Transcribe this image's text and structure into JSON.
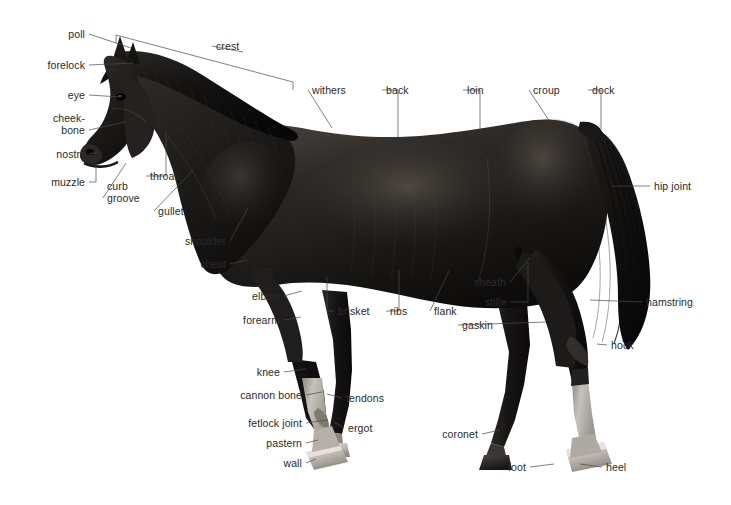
{
  "figure": {
    "view": "left-side profile, facing left",
    "coat_color": "#1d1b1a",
    "background_color": "#ffffff",
    "leader_line_color": "#4a4a4a",
    "label_text_color": "#2a2a2a",
    "marking_color": "#b9b5ae",
    "hoof_color": "#cfcac2"
  },
  "labels": [
    {
      "id": "poll",
      "text": "poll",
      "align": "right",
      "x": 27,
      "y": 28,
      "w": 58,
      "tip": [
        131,
        48
      ]
    },
    {
      "id": "crest",
      "text": "crest",
      "align": "left",
      "x": 216,
      "y": 40,
      "w": 50,
      "tip": [
        243,
        52
      ]
    },
    {
      "id": "forelock",
      "text": "forelock",
      "align": "right",
      "x": 16,
      "y": 59,
      "w": 69,
      "tip": [
        133,
        63
      ]
    },
    {
      "id": "withers",
      "text": "withers",
      "align": "left",
      "x": 312,
      "y": 84,
      "w": 46,
      "tip": [
        332,
        128
      ]
    },
    {
      "id": "back",
      "text": "back",
      "align": "left",
      "x": 386,
      "y": 84,
      "w": 32,
      "tip": [
        398,
        137
      ]
    },
    {
      "id": "loin",
      "text": "loin",
      "align": "left",
      "x": 467,
      "y": 84,
      "w": 28,
      "tip": [
        480,
        130
      ]
    },
    {
      "id": "croup",
      "text": "croup",
      "align": "left",
      "x": 533,
      "y": 84,
      "w": 38,
      "tip": [
        550,
        122
      ]
    },
    {
      "id": "dock",
      "text": "dock",
      "align": "left",
      "x": 592,
      "y": 84,
      "w": 33,
      "tip": [
        601,
        129
      ]
    },
    {
      "id": "eye",
      "text": "eye",
      "align": "right",
      "x": 27,
      "y": 89,
      "w": 58,
      "tip": [
        120,
        97
      ]
    },
    {
      "id": "cheekbone",
      "text": "cheek-\nbone",
      "align": "right",
      "x": 20,
      "y": 112,
      "w": 65,
      "tip": [
        125,
        122
      ]
    },
    {
      "id": "nostril",
      "text": "nostril",
      "align": "right",
      "x": 27,
      "y": 148,
      "w": 58,
      "tip": [
        98,
        152
      ]
    },
    {
      "id": "hipjoint",
      "text": "hip joint",
      "align": "left",
      "x": 654,
      "y": 180,
      "w": 52,
      "tip": [
        612,
        186
      ]
    },
    {
      "id": "throat",
      "text": "throat",
      "align": "left",
      "x": 150,
      "y": 170,
      "w": 42,
      "tip": [
        166,
        131
      ]
    },
    {
      "id": "muzzle",
      "text": "muzzle",
      "align": "right",
      "x": 22,
      "y": 176,
      "w": 63,
      "tip": [
        96,
        163
      ]
    },
    {
      "id": "curbgroove",
      "text": "curb\ngroove",
      "align": "left",
      "x": 107,
      "y": 180,
      "w": 48,
      "tip": [
        126,
        163
      ]
    },
    {
      "id": "gullet",
      "text": "gullet",
      "align": "left",
      "x": 158,
      "y": 205,
      "w": 38,
      "tip": [
        194,
        169
      ]
    },
    {
      "id": "shoulder",
      "text": "shoulder",
      "align": "right",
      "x": 163,
      "y": 235,
      "w": 63,
      "tip": [
        248,
        208
      ]
    },
    {
      "id": "chest",
      "text": "chest",
      "align": "right",
      "x": 163,
      "y": 258,
      "w": 63,
      "tip": [
        247,
        260
      ]
    },
    {
      "id": "sheath",
      "text": "sheath",
      "align": "right",
      "x": 458,
      "y": 276,
      "w": 48,
      "tip": [
        530,
        258
      ]
    },
    {
      "id": "elbow",
      "text": "elbow",
      "align": "right",
      "x": 228,
      "y": 290,
      "w": 52,
      "tip": [
        302,
        291
      ]
    },
    {
      "id": "stifle",
      "text": "stifle",
      "align": "right",
      "x": 466,
      "y": 296,
      "w": 41,
      "tip": [
        528,
        262
      ]
    },
    {
      "id": "flank",
      "text": "flank",
      "align": "left",
      "x": 434,
      "y": 305,
      "w": 33,
      "tip": [
        449,
        271
      ]
    },
    {
      "id": "brisket",
      "text": "brisket",
      "align": "left",
      "x": 338,
      "y": 305,
      "w": 43,
      "tip": [
        327,
        277
      ]
    },
    {
      "id": "ribs",
      "text": "ribs",
      "align": "left",
      "x": 390,
      "y": 305,
      "w": 26,
      "tip": [
        399,
        270
      ]
    },
    {
      "id": "hamstring",
      "text": "hamstring",
      "align": "left",
      "x": 646,
      "y": 296,
      "w": 60,
      "tip": [
        590,
        300
      ]
    },
    {
      "id": "forearm",
      "text": "forearm",
      "align": "right",
      "x": 228,
      "y": 314,
      "w": 52,
      "tip": [
        301,
        317
      ]
    },
    {
      "id": "gaskin",
      "text": "gaskin",
      "align": "left",
      "x": 462,
      "y": 319,
      "w": 42,
      "tip": [
        546,
        322
      ]
    },
    {
      "id": "hock",
      "text": "hock",
      "align": "left",
      "x": 611,
      "y": 339,
      "w": 32,
      "tip": [
        597,
        344
      ]
    },
    {
      "id": "knee",
      "text": "knee",
      "align": "right",
      "x": 228,
      "y": 366,
      "w": 52,
      "tip": [
        306,
        369
      ]
    },
    {
      "id": "cannonbone",
      "text": "cannon bone",
      "align": "right",
      "x": 222,
      "y": 389,
      "w": 80,
      "tip": [
        322,
        392
      ]
    },
    {
      "id": "tendons",
      "text": "tendons",
      "align": "left",
      "x": 346,
      "y": 392,
      "w": 47,
      "tip": [
        327,
        394
      ]
    },
    {
      "id": "fetlockjoint",
      "text": "fetlock joint",
      "align": "right",
      "x": 222,
      "y": 417,
      "w": 80,
      "tip": [
        328,
        420
      ]
    },
    {
      "id": "ergot",
      "text": "ergot",
      "align": "left",
      "x": 348,
      "y": 422,
      "w": 35,
      "tip": [
        334,
        422
      ]
    },
    {
      "id": "coronet",
      "text": "coronet",
      "align": "right",
      "x": 426,
      "y": 428,
      "w": 52,
      "tip": [
        500,
        430
      ]
    },
    {
      "id": "pastern",
      "text": "pastern",
      "align": "right",
      "x": 222,
      "y": 437,
      "w": 80,
      "tip": [
        318,
        440
      ]
    },
    {
      "id": "wall",
      "text": "wall",
      "align": "right",
      "x": 222,
      "y": 457,
      "w": 80,
      "tip": [
        316,
        459
      ]
    },
    {
      "id": "foot",
      "text": "foot",
      "align": "right",
      "x": 490,
      "y": 461,
      "w": 36,
      "tip": [
        554,
        464
      ]
    },
    {
      "id": "heel",
      "text": "heel",
      "align": "left",
      "x": 606,
      "y": 461,
      "w": 30,
      "tip": [
        580,
        464
      ]
    }
  ],
  "crest_bracket": {
    "id": "crest-bracket",
    "start": [
      116,
      35
    ],
    "end": [
      293,
      82
    ],
    "tick_len": 8
  }
}
